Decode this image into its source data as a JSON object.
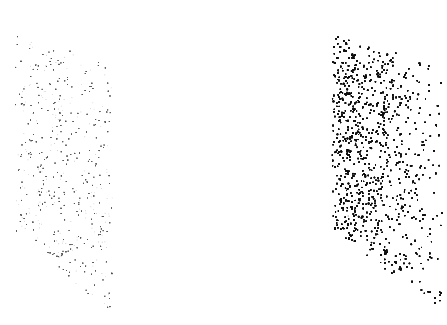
{
  "canvas": {
    "width": 447,
    "height": 325,
    "background": "#ffffff"
  },
  "panels": [
    {
      "name": "left-stippled-panel",
      "tone": "light",
      "corners": [
        [
          14,
          32
        ],
        [
          111,
          62
        ],
        [
          113,
          318
        ],
        [
          16,
          232
        ]
      ],
      "dot_color": "#555555",
      "density_left": 0.09,
      "density_right": 0.09,
      "dot_alpha": 0.6
    },
    {
      "name": "right-stippled-panel",
      "tone": "dark-gradient",
      "corners": [
        [
          331,
          31
        ],
        [
          443,
          66
        ],
        [
          444,
          320
        ],
        [
          332,
          227
        ]
      ],
      "dot_color": "#111111",
      "density_left": 0.62,
      "density_right": 0.05,
      "dot_alpha": 0.85
    }
  ]
}
